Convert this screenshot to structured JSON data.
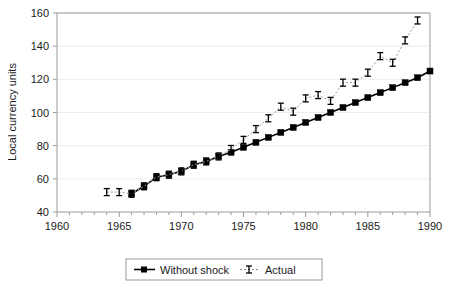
{
  "chart_data": {
    "type": "line",
    "title": "",
    "xlabel": "",
    "ylabel": "Local currency units",
    "xlim": [
      1960,
      1990
    ],
    "ylim": [
      40,
      160
    ],
    "x_ticks": [
      1960,
      1965,
      1970,
      1975,
      1980,
      1985,
      1990
    ],
    "x_tick_labels": [
      "1960",
      "1965",
      "1970",
      "1975",
      "1980",
      "1985",
      "1990"
    ],
    "x_minor_tick_step": 1,
    "y_ticks": [
      40,
      60,
      80,
      100,
      120,
      140,
      160
    ],
    "y_tick_labels": [
      "40",
      "60",
      "80",
      "100",
      "120",
      "140",
      "160"
    ],
    "grid": "horizontal",
    "legend_position": "bottom-center",
    "series": [
      {
        "name": "Without shock",
        "marker": "filled-square",
        "line_style": "solid",
        "color": "#000000",
        "x": [
          1966,
          1967,
          1968,
          1969,
          1970,
          1971,
          1972,
          1973,
          1974,
          1975,
          1976,
          1977,
          1978,
          1979,
          1980,
          1981,
          1982,
          1983,
          1984,
          1985,
          1986,
          1987,
          1988,
          1989,
          1990
        ],
        "values": [
          51,
          55.5,
          61,
          62.5,
          64.5,
          68.5,
          70.5,
          73.5,
          76,
          79,
          82,
          85,
          88,
          91,
          94,
          97,
          100,
          103,
          106,
          109,
          112,
          115,
          118,
          121,
          125
        ]
      },
      {
        "name": "Actual",
        "marker": "i-bar",
        "line_style": "dotted",
        "color": "#000000",
        "x": [
          1964,
          1965,
          1966,
          1967,
          1968,
          1969,
          1970,
          1971,
          1972,
          1973,
          1974,
          1975,
          1976,
          1977,
          1978,
          1979,
          1980,
          1981,
          1982,
          1983,
          1984,
          1985,
          1986,
          1987,
          1988,
          1989
        ],
        "values": [
          52,
          52,
          51,
          55.5,
          61,
          62.5,
          64.5,
          68.5,
          70.5,
          73.5,
          78,
          83.5,
          90,
          96.5,
          103.5,
          100.5,
          108.5,
          110.5,
          107,
          118,
          118,
          124,
          134,
          130,
          143.5,
          155.5
        ]
      }
    ]
  },
  "legend": {
    "entries": [
      {
        "label": "Without shock"
      },
      {
        "label": "Actual"
      }
    ]
  }
}
